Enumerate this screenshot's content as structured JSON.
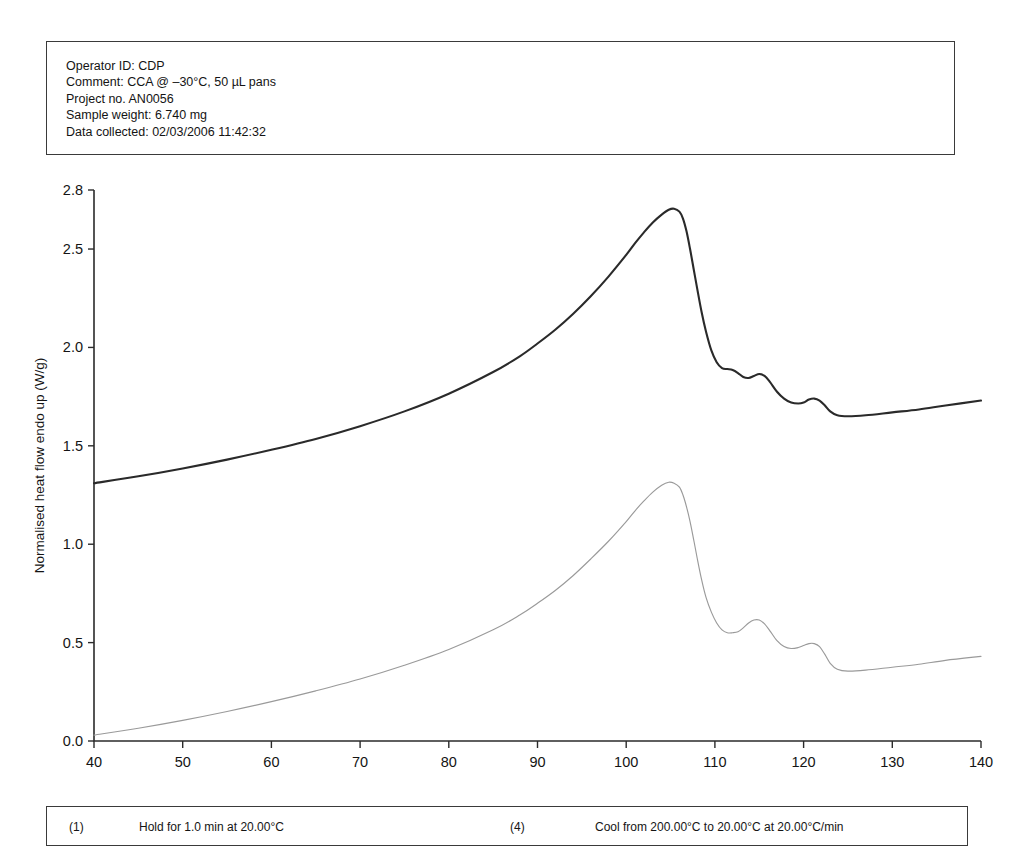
{
  "header": {
    "lines": [
      "Operator ID: CDP",
      "Comment: CCA @ –30°C, 50 µL pans",
      "Project no. AN0056",
      "Sample weight: 6.740 mg",
      "Data collected: 02/03/2006 11:42:32"
    ]
  },
  "footer": {
    "steps": [
      {
        "number": "(1)",
        "text": "Hold for 1.0 min at 20.00°C"
      },
      {
        "number": "(4)",
        "text": "Cool from 200.00°C to 20.00°C at 20.00°C/min"
      }
    ]
  },
  "chart_data": {
    "type": "line",
    "title": "",
    "xlabel": "Temperature (°C)",
    "ylabel": "Normalised heat flow endo up (W/g)",
    "xlim": [
      40,
      140
    ],
    "ylim": [
      0.0,
      2.8
    ],
    "xticks": [
      40,
      50,
      60,
      70,
      80,
      90,
      100,
      110,
      120,
      130,
      140
    ],
    "xticklabels": [
      "40",
      "50",
      "60",
      "70",
      "80",
      "90",
      "100",
      "110",
      "120",
      "130",
      "140"
    ],
    "yticks": [
      0.0,
      0.5,
      1.0,
      1.5,
      2.0,
      2.5,
      2.8
    ],
    "yticklabels": [
      "0.0",
      "0.5",
      "1.0",
      "1.5",
      "2.0",
      "2.5",
      "2.8"
    ],
    "grid": false,
    "legend": "none",
    "series": [
      {
        "name": "upper-trace",
        "color": "#2a2a2a",
        "x": [
          40,
          45,
          50,
          55,
          60,
          65,
          70,
          75,
          80,
          85,
          88,
          90,
          92,
          94,
          96,
          98,
          100,
          101,
          102,
          103,
          104,
          104.8,
          105.4,
          106,
          106.4,
          106.8,
          107.2,
          107.6,
          108,
          108.5,
          109,
          109.6,
          110.2,
          110.8,
          111.4,
          112,
          112.6,
          113.2,
          113.8,
          114.4,
          115,
          115.6,
          116.2,
          117,
          117.8,
          118.6,
          119.4,
          120,
          120.6,
          121.2,
          121.8,
          122.4,
          123,
          123.8,
          125,
          127,
          130,
          133,
          136,
          140
        ],
        "y": [
          1.31,
          1.345,
          1.385,
          1.43,
          1.48,
          1.535,
          1.6,
          1.675,
          1.765,
          1.875,
          1.955,
          2.02,
          2.09,
          2.17,
          2.26,
          2.36,
          2.47,
          2.53,
          2.585,
          2.635,
          2.675,
          2.7,
          2.705,
          2.69,
          2.655,
          2.59,
          2.5,
          2.4,
          2.3,
          2.18,
          2.08,
          1.985,
          1.925,
          1.895,
          1.89,
          1.885,
          1.87,
          1.85,
          1.845,
          1.855,
          1.865,
          1.855,
          1.825,
          1.775,
          1.74,
          1.72,
          1.715,
          1.72,
          1.735,
          1.74,
          1.73,
          1.705,
          1.675,
          1.655,
          1.65,
          1.655,
          1.67,
          1.685,
          1.705,
          1.73
        ]
      },
      {
        "name": "lower-trace",
        "color": "#9a9a9a",
        "x": [
          40,
          45,
          50,
          55,
          60,
          65,
          70,
          75,
          80,
          85,
          88,
          90,
          92,
          94,
          96,
          98,
          100,
          101,
          102,
          103,
          104,
          104.8,
          105.4,
          106,
          106.4,
          106.8,
          107.2,
          107.6,
          108,
          108.5,
          109,
          109.6,
          110.2,
          110.8,
          111.4,
          112,
          112.6,
          113.2,
          113.8,
          114.4,
          115,
          115.6,
          116.2,
          117,
          117.8,
          118.6,
          119.4,
          120,
          120.6,
          121.2,
          121.8,
          122.4,
          123,
          123.8,
          125,
          127,
          130,
          133,
          136,
          140
        ],
        "y": [
          0.03,
          0.065,
          0.105,
          0.15,
          0.2,
          0.255,
          0.315,
          0.385,
          0.465,
          0.565,
          0.64,
          0.7,
          0.765,
          0.84,
          0.925,
          1.015,
          1.115,
          1.17,
          1.22,
          1.265,
          1.3,
          1.315,
          1.31,
          1.29,
          1.25,
          1.19,
          1.115,
          1.025,
          0.93,
          0.82,
          0.73,
          0.655,
          0.6,
          0.565,
          0.55,
          0.55,
          0.555,
          0.575,
          0.6,
          0.615,
          0.615,
          0.595,
          0.56,
          0.51,
          0.48,
          0.47,
          0.475,
          0.485,
          0.495,
          0.495,
          0.48,
          0.44,
          0.395,
          0.365,
          0.355,
          0.36,
          0.375,
          0.39,
          0.41,
          0.43
        ]
      }
    ],
    "annotations": {
      "upper_peak_temperature": 105.4,
      "upper_peak_value": 2.705,
      "lower_peak_temperature": 104.8,
      "lower_peak_value": 1.315
    }
  }
}
